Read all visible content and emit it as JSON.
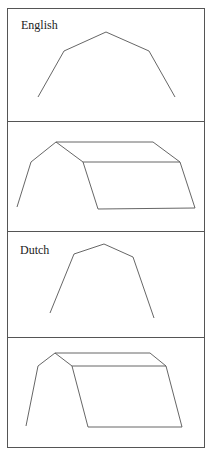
{
  "panels": [
    {
      "label": "English",
      "view": "end-elevation"
    },
    {
      "label": "",
      "view": "perspective"
    },
    {
      "label": "Dutch",
      "view": "end-elevation"
    },
    {
      "label": "",
      "view": "perspective"
    }
  ],
  "labels": {
    "english": "English",
    "dutch": "Dutch"
  },
  "colors": {
    "line": "#555555",
    "background": "#ffffff"
  }
}
